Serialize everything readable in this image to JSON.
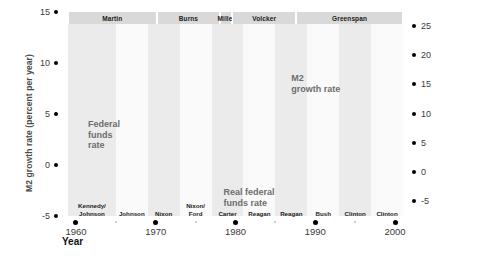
{
  "chart_data": {
    "type": "line",
    "title": "",
    "xlabel": "Year",
    "ylabel_left": "M2 growth rate (percent per year)",
    "ylabel_right": "Interest rate (percent per year)",
    "xlim": [
      1959,
      2001
    ],
    "ylim_left": [
      -5,
      15
    ],
    "ylim_right": [
      -7.5,
      27.5
    ],
    "xticks": [
      1960,
      1970,
      1980,
      1990,
      2000
    ],
    "yticks_left": [
      -5,
      0,
      5,
      10,
      15
    ],
    "yticks_right": [
      -5,
      0,
      5,
      10,
      15,
      20,
      25
    ],
    "grid": false,
    "legend": "inline-annotations",
    "series": [
      {
        "name": "M2 growth rate",
        "axis": "left",
        "x": [
          1959,
          1960,
          1961,
          1962,
          1963,
          1964,
          1965,
          1966,
          1967,
          1968,
          1969,
          1970,
          1971,
          1972,
          1973,
          1974,
          1975,
          1976,
          1977,
          1978,
          1979,
          1980,
          1981,
          1982,
          1983,
          1984,
          1985,
          1986,
          1987,
          1988,
          1989,
          1990,
          1991,
          1992,
          1993,
          1994,
          1995,
          1996,
          1997,
          1998,
          1999,
          2000
        ],
        "values": [
          1.5,
          4.9,
          7.4,
          8.1,
          8.4,
          8.0,
          8.1,
          4.6,
          9.3,
          8.0,
          3.7,
          6.6,
          13.5,
          13.0,
          6.9,
          5.5,
          12.6,
          13.7,
          10.6,
          8.0,
          7.9,
          8.5,
          9.9,
          8.7,
          11.3,
          8.6,
          8.0,
          9.2,
          3.6,
          5.2,
          4.9,
          3.8,
          3.1,
          1.7,
          1.4,
          0.6,
          2.1,
          4.6,
          5.6,
          8.5,
          6.2,
          6.2
        ]
      },
      {
        "name": "Federal funds rate",
        "axis": "right",
        "x": [
          1959,
          1960,
          1961,
          1962,
          1963,
          1964,
          1965,
          1966,
          1967,
          1968,
          1969,
          1970,
          1971,
          1972,
          1973,
          1974,
          1975,
          1976,
          1977,
          1978,
          1979,
          1980,
          1981,
          1982,
          1983,
          1984,
          1985,
          1986,
          1987,
          1988,
          1989,
          1990,
          1991,
          1992,
          1993,
          1994,
          1995,
          1996,
          1997,
          1998,
          1999,
          2000
        ],
        "values": [
          3.3,
          3.2,
          2.0,
          2.7,
          3.2,
          3.5,
          4.1,
          5.1,
          4.2,
          5.7,
          8.2,
          7.2,
          4.7,
          4.4,
          8.7,
          10.5,
          5.8,
          5.0,
          5.5,
          7.9,
          11.2,
          13.4,
          16.4,
          12.3,
          9.1,
          10.2,
          8.1,
          6.8,
          6.7,
          7.6,
          9.2,
          8.1,
          5.7,
          3.5,
          3.0,
          4.2,
          5.8,
          5.3,
          5.5,
          5.4,
          5.0,
          6.2
        ]
      },
      {
        "name": "Real federal funds rate",
        "axis": "right",
        "x": [
          1959,
          1960,
          1961,
          1962,
          1963,
          1964,
          1965,
          1966,
          1967,
          1968,
          1969,
          1970,
          1971,
          1972,
          1973,
          1974,
          1975,
          1976,
          1977,
          1978,
          1979,
          1980,
          1981,
          1982,
          1983,
          1984,
          1985,
          1986,
          1987,
          1988,
          1989,
          1990,
          1991,
          1992,
          1993,
          1994,
          1995,
          1996,
          1997,
          1998,
          1999,
          2000
        ],
        "values": [
          2.5,
          2.0,
          0.9,
          1.5,
          1.9,
          2.2,
          2.4,
          2.3,
          1.3,
          1.5,
          3.0,
          1.4,
          0.4,
          0.9,
          2.5,
          -0.7,
          -3.5,
          -0.3,
          -1.1,
          0.3,
          0.9,
          0.0,
          4.4,
          6.1,
          5.6,
          6.0,
          4.6,
          4.2,
          3.3,
          3.6,
          4.6,
          3.0,
          1.6,
          0.5,
          0.1,
          1.7,
          3.0,
          2.3,
          3.0,
          3.3,
          2.8,
          2.8
        ]
      }
    ],
    "annotations": [
      {
        "text": "Federal\nfunds\nrate",
        "x": 1961.5,
        "y": 4.5
      },
      {
        "text": "M2\ngrowth rate",
        "x": 1987.0,
        "y": 9.0
      },
      {
        "text": "Real federal\nfunds rate",
        "x": 1978.5,
        "y": -2.2
      }
    ],
    "fed_chairs": [
      {
        "label": "Martin",
        "start": 1959,
        "end": 1970.1
      },
      {
        "label": "Burns",
        "start": 1970.1,
        "end": 1978.1
      },
      {
        "label": "Miller",
        "start": 1978.1,
        "end": 1979.6
      },
      {
        "label": "Volcker",
        "start": 1979.6,
        "end": 1987.6
      },
      {
        "label": "Greenspan",
        "start": 1987.6,
        "end": 2001
      }
    ],
    "presidents": [
      {
        "label": "Kennedy/\nJohnson",
        "start": 1959,
        "end": 1965
      },
      {
        "label": "Johnson",
        "start": 1965,
        "end": 1969
      },
      {
        "label": "Nixon",
        "start": 1969,
        "end": 1973
      },
      {
        "label": "Nixon/\nFord",
        "start": 1973,
        "end": 1977
      },
      {
        "label": "Carter",
        "start": 1977,
        "end": 1981
      },
      {
        "label": "Reagan",
        "start": 1981,
        "end": 1985
      },
      {
        "label": "Reagan",
        "start": 1985,
        "end": 1989
      },
      {
        "label": "Bush",
        "start": 1989,
        "end": 1993
      },
      {
        "label": "Clinton",
        "start": 1993,
        "end": 1997
      },
      {
        "label": "Clinton",
        "start": 1997,
        "end": 2001
      }
    ],
    "colors": {
      "line": "#8a8a8a",
      "band_light": "#ebebeb",
      "band_white": "#fafafa",
      "chair_band": "#d9d9d9",
      "annotation_text": "#6d6d6d",
      "axis_title": "#4a4a4a"
    }
  },
  "axes": {
    "left_title": "M2 growth rate (percent per year)",
    "right_title": "Interest rate (percent per year)",
    "x_title": "Year",
    "left_ticks": [
      "15",
      "10",
      "5",
      "0",
      "-5"
    ],
    "right_ticks": [
      "25",
      "20",
      "15",
      "10",
      "5",
      "0",
      "-5"
    ],
    "x_ticks": [
      "1960",
      "1970",
      "1980",
      "1990",
      "2000"
    ]
  }
}
